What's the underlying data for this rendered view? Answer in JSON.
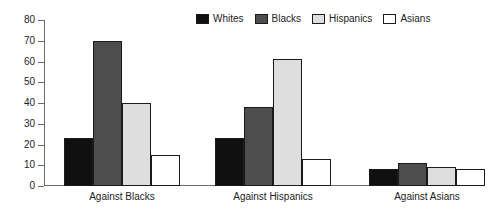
{
  "chart_data": {
    "type": "bar",
    "title": "",
    "subtitle": "",
    "xlabel": "",
    "ylabel": "",
    "ylim": [
      0,
      80
    ],
    "ytick_step": 10,
    "yticks": [
      80,
      70,
      60,
      50,
      40,
      30,
      20,
      10,
      0
    ],
    "grid": false,
    "legend_position": "top-right",
    "categories": [
      "Against Blacks",
      "Against Hispanics",
      "Against Asians"
    ],
    "series": [
      {
        "name": "Whites",
        "color": "#101010",
        "values": [
          23,
          23,
          8
        ]
      },
      {
        "name": "Blacks",
        "color": "#4d4d4d",
        "values": [
          70,
          38,
          11
        ]
      },
      {
        "name": "Hispanics",
        "color": "#dedede",
        "values": [
          40,
          61,
          9
        ]
      },
      {
        "name": "Asians",
        "color": "#ffffff",
        "values": [
          15,
          13,
          8
        ]
      }
    ]
  },
  "legend": {
    "items": [
      {
        "label": "Whites"
      },
      {
        "label": "Blacks"
      },
      {
        "label": "Hispanics"
      },
      {
        "label": "Asians"
      }
    ]
  },
  "axis": {
    "y": {
      "labels": [
        "80",
        "70",
        "60",
        "50",
        "40",
        "30",
        "20",
        "10",
        "0"
      ]
    },
    "x": {
      "labels": [
        "Against Blacks",
        "Against Hispanics",
        "Against Asians"
      ]
    }
  }
}
